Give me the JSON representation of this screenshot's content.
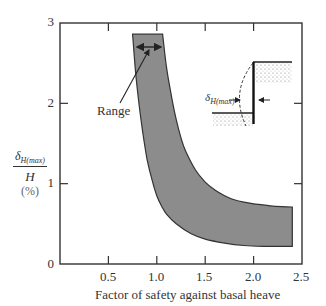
{
  "chart_data": {
    "type": "area",
    "title": "",
    "xlabel": "Factor of safety against basal heave",
    "ylabel": "δH(max) / H (%)",
    "ylabel_parts": {
      "numerator": "δ",
      "subscript": "H(max)",
      "denominator": "H",
      "unit": "(%)"
    },
    "xlim": [
      0,
      2.5
    ],
    "ylim": [
      0,
      3
    ],
    "xticks": [
      0.5,
      1.0,
      1.5,
      2.0,
      2.5
    ],
    "xtick_labels": [
      "0.5",
      "1.0",
      "1.5",
      "2.0",
      "2.5"
    ],
    "yticks": [
      0,
      1,
      2,
      3
    ],
    "ytick_labels": [
      "0",
      "1",
      "2",
      "3"
    ],
    "grid": false,
    "legend": null,
    "series": [
      {
        "name": "Lower bound",
        "x": [
          0.75,
          0.78,
          0.82,
          0.86,
          0.9,
          0.95,
          1.0,
          1.05,
          1.1,
          1.2,
          1.35,
          1.5,
          1.7,
          1.9,
          2.1,
          2.4
        ],
        "values": [
          2.86,
          2.4,
          1.95,
          1.6,
          1.3,
          1.05,
          0.85,
          0.72,
          0.62,
          0.5,
          0.38,
          0.31,
          0.26,
          0.23,
          0.22,
          0.22
        ]
      },
      {
        "name": "Upper bound",
        "x": [
          1.06,
          1.1,
          1.15,
          1.2,
          1.25,
          1.3,
          1.4,
          1.5,
          1.6,
          1.7,
          1.8,
          1.9,
          2.0,
          2.2,
          2.4
        ],
        "values": [
          2.86,
          2.45,
          2.1,
          1.8,
          1.57,
          1.4,
          1.17,
          1.02,
          0.92,
          0.85,
          0.8,
          0.77,
          0.75,
          0.72,
          0.71
        ]
      }
    ],
    "band_fill_color": "#8c8c8c",
    "annotations": [
      {
        "text": "Range",
        "x": 0.62,
        "y": 1.93,
        "arrow_to": [
          0.93,
          2.27
        ],
        "note": "double arrow spanning band width at y≈2.27"
      }
    ],
    "inset": {
      "description": "Retaining wall schematic with deflected shape",
      "label": "δ",
      "label_subscript": "H(max)"
    }
  }
}
